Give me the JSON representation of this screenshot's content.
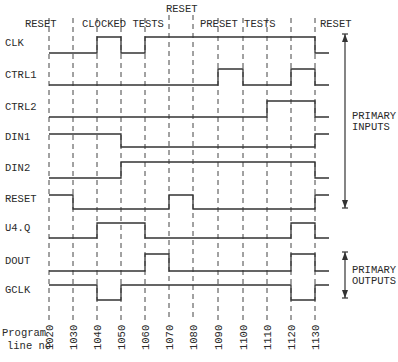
{
  "diagram": {
    "sections": [
      {
        "label": "RESET",
        "x": 25,
        "y": 27
      },
      {
        "label": "CLOCKED TESTS",
        "x": 82,
        "y": 27
      },
      {
        "label": "RESET",
        "x": 166,
        "y": 12
      },
      {
        "label": "PRESET TESTS",
        "x": 200,
        "y": 27
      },
      {
        "label": "RESET",
        "x": 320,
        "y": 27
      }
    ],
    "program_line_label_1": "Program",
    "program_line_label_2": "line no",
    "program_lines": [
      "1020",
      "1030",
      "1040",
      "1050",
      "1060",
      "1070",
      "1080",
      "1090",
      "1100",
      "1110",
      "1120",
      "1130"
    ],
    "signals": [
      {
        "name": "CLK",
        "low_y": 53,
        "high_y": 37,
        "levels": [
          0,
          0,
          1,
          0,
          1,
          1,
          1,
          1,
          1,
          1,
          1,
          0
        ]
      },
      {
        "name": "CTRL1",
        "low_y": 85,
        "high_y": 69,
        "levels": [
          0,
          0,
          0,
          0,
          0,
          0,
          0,
          1,
          0,
          0,
          1,
          0
        ]
      },
      {
        "name": "CTRL2",
        "low_y": 117,
        "high_y": 101,
        "levels": [
          0,
          0,
          0,
          0,
          0,
          0,
          0,
          0,
          0,
          1,
          1,
          0
        ]
      },
      {
        "name": "DIN1",
        "low_y": 147,
        "high_y": 134,
        "levels": [
          1,
          1,
          1,
          0,
          0,
          0,
          0,
          0,
          0,
          0,
          0,
          1
        ]
      },
      {
        "name": "DIN2",
        "low_y": 178,
        "high_y": 162,
        "levels": [
          0,
          0,
          0,
          1,
          1,
          1,
          1,
          1,
          1,
          1,
          1,
          0
        ]
      },
      {
        "name": "RESET",
        "low_y": 209,
        "high_y": 195,
        "levels": [
          1,
          0,
          0,
          0,
          0,
          1,
          0,
          0,
          0,
          0,
          0,
          1
        ]
      },
      {
        "name": "U4.Q",
        "low_y": 238,
        "high_y": 223,
        "levels": [
          0,
          0,
          1,
          1,
          0,
          0,
          0,
          0,
          0,
          0,
          1,
          0
        ]
      },
      {
        "name": "DOUT",
        "low_y": 271,
        "high_y": 254,
        "levels": [
          0,
          0,
          0,
          0,
          1,
          0,
          0,
          0,
          0,
          0,
          1,
          0
        ]
      },
      {
        "name": "GCLK",
        "low_y": 300,
        "high_y": 285,
        "levels": [
          1,
          1,
          0,
          1,
          1,
          1,
          1,
          1,
          1,
          1,
          0,
          1
        ]
      }
    ],
    "groups": [
      {
        "label_1": "PRIMARY",
        "label_2": "INPUTS",
        "top_y": 34,
        "bottom_y": 208
      },
      {
        "label_1": "PRIMARY",
        "label_2": "OUTPUTS",
        "top_y": 252,
        "bottom_y": 298
      }
    ]
  }
}
